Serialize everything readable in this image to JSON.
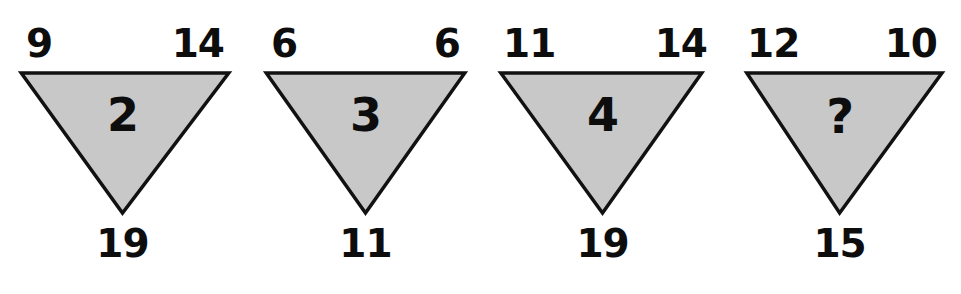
{
  "figure": {
    "kind": "triangle-number-puzzle",
    "background_color": "#ffffff",
    "shape_fill_color": "#c8c8c8",
    "shape_stroke_color": "#111111",
    "text_color": "#0d0d0d",
    "unknown_marker": "?"
  },
  "chart_data": {
    "type": "table",
    "title": "",
    "xlabel": "",
    "ylabel": "",
    "columns": [
      "position",
      "top_left",
      "top_right",
      "bottom",
      "center"
    ],
    "rows": [
      [
        "1",
        "9",
        "14",
        "19",
        "2"
      ],
      [
        "2",
        "6",
        "6",
        "11",
        "3"
      ],
      [
        "3",
        "11",
        "14",
        "19",
        "4"
      ],
      [
        "4",
        "12",
        "10",
        "15",
        "?"
      ]
    ]
  },
  "triangles": [
    {
      "index": "1",
      "name": "triangle-1",
      "top_left": "9",
      "top_right": "14",
      "bottom": "19",
      "center": "2",
      "is_unknown": false,
      "left": 0,
      "width": 250,
      "apex_center_pct": 49,
      "tl_label_left": 26,
      "tr_label_right": 26,
      "shape_left_pct": 8.5,
      "shape_right_pct": 91.5
    },
    {
      "index": "2",
      "name": "triangle-2",
      "top_left": "6",
      "top_right": "6",
      "bottom": "11",
      "center": "3",
      "is_unknown": false,
      "left": 243,
      "width": 245,
      "apex_center_pct": 50,
      "tl_label_left": 28,
      "tr_label_right": 28,
      "shape_left_pct": 9.5,
      "shape_right_pct": 90.5
    },
    {
      "index": "3",
      "name": "triangle-3",
      "top_left": "11",
      "top_right": "14",
      "bottom": "19",
      "center": "4",
      "is_unknown": false,
      "left": 481,
      "width": 248,
      "apex_center_pct": 49,
      "tl_label_left": 22,
      "tr_label_right": 22,
      "shape_left_pct": 8,
      "shape_right_pct": 89
    },
    {
      "index": "4",
      "name": "triangle-4",
      "top_left": "12",
      "top_right": "10",
      "bottom": "15",
      "center": "?",
      "is_unknown": true,
      "left": 723,
      "width": 238,
      "apex_center_pct": 49,
      "tl_label_left": 24,
      "tr_label_right": 24,
      "shape_left_pct": 10,
      "shape_right_pct": 92
    }
  ]
}
